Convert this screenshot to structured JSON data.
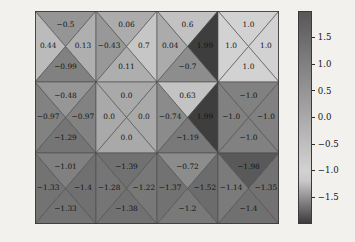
{
  "chart_data": {
    "type": "heatmap",
    "title": "",
    "xlabel": "",
    "ylabel": "",
    "subtitle": "",
    "grid": false,
    "legend_position": "right",
    "colormap": "gray",
    "vmin": -2.0,
    "vmax": 2.0,
    "cell_layout": "each grid cell is split by both diagonals into four triangles: top, left, right, bottom",
    "rows": 3,
    "cols": 4,
    "colorbar": {
      "ticks": [
        1.5,
        1.0,
        0.5,
        0.0,
        -0.5,
        -1.0,
        -1.5
      ],
      "tick_labels": [
        "1.5",
        "1.0",
        "0.5",
        "0.0",
        "−0.5",
        "−1.0",
        "−1.5"
      ],
      "range": [
        -2.0,
        2.0
      ],
      "orientation": "vertical"
    },
    "cells": [
      [
        {
          "top": -0.5,
          "left": 0.44,
          "right": 0.13,
          "bottom": -0.99,
          "top_label": "−0.5",
          "left_label": "0.44",
          "right_label": "0.13",
          "bottom_label": "−0.99"
        },
        {
          "top": 0.06,
          "left": -0.43,
          "right": 0.7,
          "bottom": 0.11,
          "top_label": "0.06",
          "left_label": "−0.43",
          "right_label": "0.7",
          "bottom_label": "0.11"
        },
        {
          "top": 0.6,
          "left": 0.04,
          "right": 1.99,
          "bottom": -0.7,
          "top_label": "0.6",
          "left_label": "0.04",
          "right_label": "1.99",
          "bottom_label": "−0.7"
        },
        {
          "top": 1.0,
          "left": 1.0,
          "right": 1.0,
          "bottom": 1.0,
          "top_label": "1.0",
          "left_label": "1.0",
          "right_label": "1.0",
          "bottom_label": "1.0"
        }
      ],
      [
        {
          "top": -0.48,
          "left": -0.97,
          "right": -0.97,
          "bottom": -1.29,
          "top_label": "−0.48",
          "left_label": "−0.97",
          "right_label": "−0.97",
          "bottom_label": "−1.29"
        },
        {
          "top": 0.0,
          "left": 0.0,
          "right": 0.0,
          "bottom": 0.0,
          "top_label": "0.0",
          "left_label": "0.0",
          "right_label": "0.0",
          "bottom_label": "0.0"
        },
        {
          "top": 0.63,
          "left": -0.74,
          "right": 1.99,
          "bottom": -1.19,
          "top_label": "0.63",
          "left_label": "−0.74",
          "right_label": "1.99",
          "bottom_label": "−1.19"
        },
        {
          "top": -1.0,
          "left": -1.0,
          "right": -1.0,
          "bottom": -1.0,
          "top_label": "−1.0",
          "left_label": "−1.0",
          "right_label": "−1.0",
          "bottom_label": "−1.0"
        }
      ],
      [
        {
          "top": -1.01,
          "left": -1.33,
          "right": -1.4,
          "bottom": -1.33,
          "top_label": "−1.01",
          "left_label": "−1.33",
          "right_label": "−1.4",
          "bottom_label": "−1.33"
        },
        {
          "top": -1.39,
          "left": -1.28,
          "right": -1.22,
          "bottom": -1.38,
          "top_label": "−1.39",
          "left_label": "−1.28",
          "right_label": "−1.22",
          "bottom_label": "−1.38"
        },
        {
          "top": -0.72,
          "left": -1.37,
          "right": -1.52,
          "bottom": -1.2,
          "top_label": "−0.72",
          "left_label": "−1.37",
          "right_label": "−1.52",
          "bottom_label": "−1.2"
        },
        {
          "top": -1.98,
          "left": -1.14,
          "right": -1.35,
          "bottom": -1.4,
          "top_label": "−1.98",
          "left_label": "−1.14",
          "right_label": "−1.35",
          "bottom_label": "−1.4"
        }
      ]
    ]
  },
  "caption": {
    "text": ""
  },
  "colors": {
    "figure_background": "#f2f1ed",
    "edge": "#4a4a4a",
    "text": "#141414",
    "colorbar_high": "#4c4c4c",
    "colorbar_mid": "#d4d4d4",
    "colorbar_low": "#595959"
  }
}
